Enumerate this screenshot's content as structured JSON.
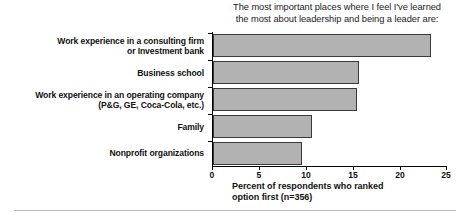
{
  "chart_data": {
    "type": "bar",
    "orientation": "horizontal",
    "title": "The most important places where I feel I've learned the most about leadership and being a leader are:",
    "title_lines": [
      "The most important places where I feel I've learned",
      "the most about leadership and being a leader are:"
    ],
    "xlabel": "Percent of respondents who ranked option first (n=356)",
    "xlabel_lines": [
      "Percent of respondents who ranked",
      "option first (n=356)"
    ],
    "ylabel": "",
    "categories": [
      "Work experience in a consulting firm or Investment bank",
      "Business school",
      "Work experience in an operating company (P&G, GE, Coca-Cola, etc.)",
      "Family",
      "Nonprofit organizations"
    ],
    "category_lines": [
      [
        "Work experience in a consulting firm",
        "or Investment bank"
      ],
      [
        "Business school"
      ],
      [
        "Work experience in an operating company",
        "(P&G, GE, Coca-Cola, etc.)"
      ],
      [
        "Family"
      ],
      [
        "Nonprofit organizations"
      ]
    ],
    "values": [
      23.4,
      15.7,
      15.4,
      10.6,
      9.6
    ],
    "xlim": [
      0,
      25
    ],
    "xticks": [
      0,
      5,
      10,
      15,
      20,
      25
    ],
    "xtick_labels": [
      "0",
      "5",
      "10",
      "15",
      "20",
      "25"
    ],
    "grid": false,
    "legend": false,
    "n": 356,
    "bar_fill_color": "#b2b2b2",
    "bar_border_color": "#3a3a3a",
    "axis_color": "#000000",
    "text_color": "#111111",
    "rule_color": "#b9b9b9"
  }
}
